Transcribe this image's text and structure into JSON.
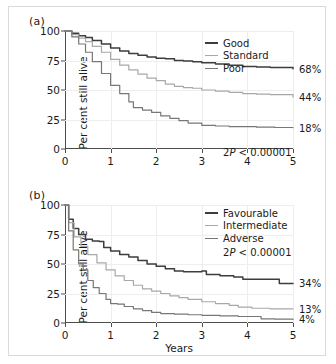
{
  "figure": {
    "panels": [
      {
        "tag": "(a)",
        "ylabel": "Per cent still alive",
        "xlabel": "",
        "pvalue": "2P < 0.00001",
        "pvalue_prefix": "2",
        "pvalue_italic": "P",
        "pvalue_suffix": " < 0.00001",
        "legend": [
          {
            "label": "Good",
            "color": "#3d3d3d"
          },
          {
            "label": "Standard",
            "color": "#a8a8a8"
          },
          {
            "label": "Poor",
            "color": "#777777"
          }
        ],
        "endlabels": [
          "68%",
          "44%",
          "18%"
        ]
      },
      {
        "tag": "(b)",
        "ylabel": "Per cent still alive",
        "xlabel": "Years",
        "pvalue": "2P < 0.00001",
        "pvalue_prefix": "2",
        "pvalue_italic": "P",
        "pvalue_suffix": " < 0.00001",
        "legend": [
          {
            "label": "Favourable",
            "color": "#3d3d3d"
          },
          {
            "label": "Intermediate",
            "color": "#a8a8a8"
          },
          {
            "label": "Adverse",
            "color": "#777777"
          }
        ],
        "endlabels": [
          "34%",
          "13%",
          "4%"
        ]
      }
    ]
  },
  "chart_data": [
    {
      "type": "line",
      "panel": "(a)",
      "title": "",
      "xlabel": "",
      "ylabel": "Per cent still alive",
      "xlim": [
        0,
        5
      ],
      "ylim": [
        0,
        100
      ],
      "xticks": [
        0,
        1,
        2,
        3,
        4,
        5
      ],
      "yticks": [
        0,
        25,
        50,
        75,
        100
      ],
      "grid": true,
      "legend_position": "top-right",
      "annotations": [
        "2P < 0.00001"
      ],
      "series": [
        {
          "name": "Good",
          "color": "#3d3d3d",
          "end_label": "68%",
          "x": [
            0,
            0.15,
            0.3,
            0.45,
            0.6,
            0.8,
            1.0,
            1.2,
            1.4,
            1.6,
            1.8,
            2.0,
            2.2,
            2.4,
            2.6,
            2.8,
            3.0,
            3.3,
            3.6,
            3.9,
            4.2,
            4.5,
            5.0
          ],
          "y": [
            100,
            98,
            96,
            94.5,
            92,
            89,
            85.5,
            83,
            81,
            79.5,
            78,
            77,
            76.5,
            75,
            74.5,
            74,
            73,
            72,
            71,
            70,
            69.5,
            69,
            68
          ]
        },
        {
          "name": "Standard",
          "color": "#a8a8a8",
          "end_label": "44%",
          "x": [
            0,
            0.15,
            0.3,
            0.45,
            0.6,
            0.8,
            1.0,
            1.2,
            1.4,
            1.6,
            1.8,
            2.0,
            2.2,
            2.4,
            2.6,
            2.8,
            3.0,
            3.3,
            3.6,
            3.9,
            4.2,
            4.5,
            5.0
          ],
          "y": [
            100,
            97,
            94,
            91,
            87,
            82,
            76,
            71,
            67,
            63.5,
            60,
            58,
            55,
            53,
            52,
            51.5,
            50,
            49,
            48,
            47,
            46.5,
            46,
            44
          ]
        },
        {
          "name": "Poor",
          "color": "#777777",
          "end_label": "18%",
          "x": [
            0,
            0.15,
            0.3,
            0.45,
            0.6,
            0.8,
            1.0,
            1.2,
            1.4,
            1.5,
            1.7,
            1.9,
            2.1,
            2.3,
            2.5,
            2.7,
            3.0,
            3.3,
            3.6,
            3.9,
            4.2,
            4.6,
            5.0
          ],
          "y": [
            100,
            95,
            89,
            82,
            74,
            64,
            54,
            47,
            40,
            35,
            33,
            31,
            28,
            26,
            24,
            22,
            20,
            19.5,
            19,
            19,
            18.5,
            18.2,
            18
          ]
        }
      ]
    },
    {
      "type": "line",
      "panel": "(b)",
      "title": "",
      "xlabel": "Years",
      "ylabel": "Per cent still alive",
      "xlim": [
        0,
        5
      ],
      "ylim": [
        0,
        100
      ],
      "xticks": [
        0,
        1,
        2,
        3,
        4,
        5
      ],
      "yticks": [
        0,
        25,
        50,
        75,
        100
      ],
      "grid": true,
      "legend_position": "top-right",
      "annotations": [
        "2P < 0.00001"
      ],
      "series": [
        {
          "name": "Favourable",
          "color": "#3d3d3d",
          "end_label": "34%",
          "x": [
            0,
            0.08,
            0.18,
            0.3,
            0.45,
            0.6,
            0.75,
            0.85,
            1.0,
            1.2,
            1.4,
            1.6,
            1.8,
            2.0,
            2.2,
            2.4,
            2.6,
            2.8,
            3.0,
            3.1,
            3.4,
            3.7,
            3.9,
            4.3,
            4.6,
            4.7,
            5.0
          ],
          "y": [
            100,
            88,
            80,
            75,
            71,
            69.5,
            69,
            64,
            61,
            58,
            56,
            53,
            50,
            48,
            46,
            44,
            43.5,
            43.5,
            44,
            41,
            40,
            39,
            37,
            37,
            37,
            33.5,
            33.5
          ]
        },
        {
          "name": "Intermediate",
          "color": "#a8a8a8",
          "end_label": "13%",
          "x": [
            0,
            0.08,
            0.2,
            0.35,
            0.5,
            0.7,
            0.9,
            1.1,
            1.3,
            1.5,
            1.7,
            1.9,
            2.1,
            2.3,
            2.5,
            2.7,
            3.0,
            3.3,
            3.6,
            3.8,
            4.1,
            4.5,
            5.0
          ],
          "y": [
            100,
            85,
            73,
            65,
            58,
            51,
            45,
            40,
            36,
            32,
            29,
            27,
            25,
            23,
            21.5,
            20,
            18,
            16.5,
            15,
            13.5,
            12.5,
            12,
            12
          ]
        },
        {
          "name": "Adverse",
          "color": "#777777",
          "end_label": "4%",
          "x": [
            0,
            0.08,
            0.18,
            0.3,
            0.4,
            0.5,
            0.62,
            0.75,
            0.9,
            1.0,
            1.15,
            1.3,
            1.5,
            1.7,
            1.9,
            2.1,
            2.4,
            2.7,
            3.0,
            3.4,
            3.8,
            4.1,
            4.3,
            4.6,
            5.0
          ],
          "y": [
            100,
            78,
            62,
            50,
            45,
            36,
            30,
            25,
            20,
            16.5,
            16,
            14,
            12,
            10.5,
            9,
            8,
            7.5,
            7,
            6.5,
            6,
            5.5,
            5.5,
            3.5,
            3.2,
            3
          ]
        }
      ]
    }
  ]
}
